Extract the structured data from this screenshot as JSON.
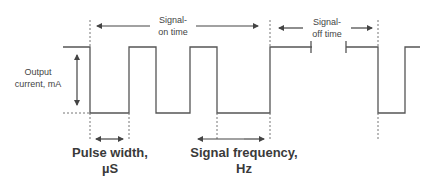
{
  "diagram": {
    "type": "pulse-waveform",
    "labels": {
      "on_time_1": "Signal-",
      "on_time_2": "on time",
      "off_time_1": "Signal-",
      "off_time_2": "off time",
      "output_1": "Output",
      "output_2": "current, mA",
      "pulse_width_1": "Pulse width,",
      "pulse_width_2": "µS",
      "frequency_1": "Signal frequency,",
      "frequency_2": "Hz"
    },
    "colors": {
      "line": "#555555",
      "text": "#444444",
      "background": "#ffffff"
    }
  }
}
